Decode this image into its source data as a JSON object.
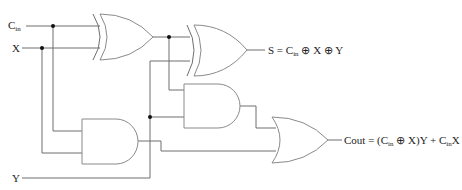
{
  "diagram": {
    "type": "full-adder-logic-circuit",
    "inputs": {
      "cin": {
        "main": "C",
        "sub": "in"
      },
      "x": "X",
      "y": "Y"
    },
    "outputs": {
      "sum": {
        "prefix": "S = C",
        "sub": "in",
        "suffix": " ⊕ X ⊕ Y"
      },
      "carry": {
        "prefix": "Cout = (C",
        "sub1": "in",
        "mid": " ⊕ X)Y + C",
        "sub2": "in",
        "suffix": "X"
      }
    },
    "gates": [
      {
        "id": "xor1",
        "type": "XOR",
        "inputs": [
          "Cin",
          "X"
        ]
      },
      {
        "id": "xor2",
        "type": "XOR",
        "inputs": [
          "xor1",
          "Y"
        ],
        "output": "S"
      },
      {
        "id": "and1",
        "type": "AND",
        "inputs": [
          "xor1",
          "Y"
        ]
      },
      {
        "id": "and2",
        "type": "AND",
        "inputs": [
          "Cin",
          "X"
        ]
      },
      {
        "id": "or1",
        "type": "OR",
        "inputs": [
          "and1",
          "and2"
        ],
        "output": "Cout"
      }
    ],
    "colors": {
      "wire": "#6e6e6e",
      "gate": "#8a8a8a",
      "junction": "#111111"
    }
  }
}
